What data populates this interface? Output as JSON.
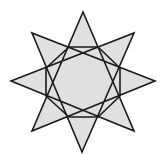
{
  "figure": {
    "type": "star-polygon",
    "schlafli": "{8/3}",
    "fill_color": "#e0e0e0",
    "stroke_color": "#1a1a1a",
    "background_color": "#ffffff",
    "outer_vertices": [
      {
        "name": "top",
        "x": 83,
        "y": 12
      },
      {
        "name": "top-right",
        "x": 134,
        "y": 33
      },
      {
        "name": "right",
        "x": 155,
        "y": 81
      },
      {
        "name": "bottom-right",
        "x": 134,
        "y": 131
      },
      {
        "name": "bottom",
        "x": 82,
        "y": 152
      },
      {
        "name": "bottom-left",
        "x": 32,
        "y": 131
      },
      {
        "name": "left",
        "x": 11,
        "y": 81
      },
      {
        "name": "top-left",
        "x": 32,
        "y": 33
      }
    ],
    "star_path_order": [
      "top",
      "bottom-right",
      "left",
      "top-right",
      "bottom",
      "top-left",
      "right",
      "bottom-left"
    ],
    "inner_octagon": [
      {
        "x": 69,
        "y": 47
      },
      {
        "x": 98,
        "y": 47
      },
      {
        "x": 120,
        "y": 68
      },
      {
        "x": 120,
        "y": 96
      },
      {
        "x": 98,
        "y": 117
      },
      {
        "x": 69,
        "y": 117
      },
      {
        "x": 46,
        "y": 96
      },
      {
        "x": 46,
        "y": 68
      }
    ]
  }
}
